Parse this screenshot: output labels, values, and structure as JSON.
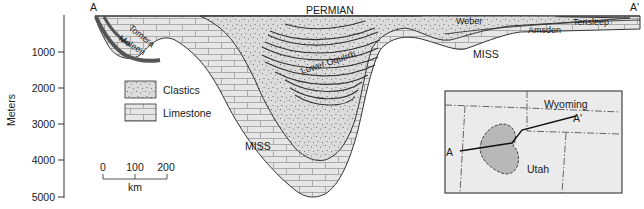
{
  "figure": {
    "type": "geologic-cross-section",
    "section_endpoints": {
      "left": "A",
      "right": "A'"
    },
    "top_label": "PERMIAN",
    "y_axis": {
      "label": "Meters",
      "ticks": [
        "1000",
        "2000",
        "3000",
        "4000",
        "5000"
      ],
      "range": [
        0,
        5000
      ]
    },
    "formations": {
      "tomera": "Tomera",
      "moleen": "Moleen",
      "lower_oquirrh": "Lower Oquirrh",
      "weber": "Weber",
      "amsden": "Amsden",
      "tensleep": "Tensleep",
      "miss_left": "MISS",
      "miss_right": "MISS"
    },
    "legend": {
      "items": [
        {
          "pattern": "stipple",
          "label": "Clastics"
        },
        {
          "pattern": "brick",
          "label": "Limestone"
        }
      ]
    },
    "scale_bar": {
      "ticks": [
        "0",
        "100",
        "200"
      ],
      "unit": "km"
    },
    "inset_map": {
      "labels": {
        "wyoming": "Wyoming",
        "utah": "Utah",
        "a": "A",
        "a_prime": "A'"
      }
    },
    "colors": {
      "limestone_fill": "#e6e6e6",
      "brick_line": "#9a9a9a",
      "clastic_fill": "#d9d9d9",
      "stipple_dot": "#555555",
      "outline": "#333333",
      "basin_fill": "#b8b8b8"
    }
  }
}
